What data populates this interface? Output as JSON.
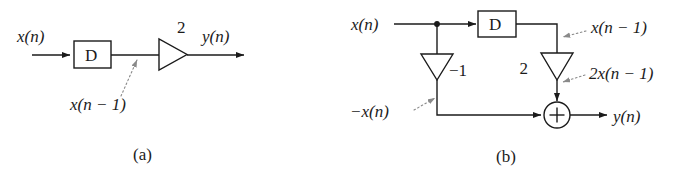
{
  "figure": {
    "background_color": "#ffffff",
    "line_color": "#1b1b1b",
    "leader_color": "#8a8a8a",
    "panels": [
      {
        "id": "panel-a",
        "caption": "(a)",
        "input_label": "x(n)",
        "output_label": "y(n)",
        "delay_block_label": "D",
        "gain_label": "2",
        "annotation_label": "x(n − 1)",
        "annotation_target": "delay-block-output-node"
      },
      {
        "id": "panel-b",
        "caption": "(b)",
        "input_label": "x(n)",
        "output_label": "y(n)",
        "delay_block_label": "D",
        "gain_top_label": "2",
        "gain_left_label": "−1",
        "summer_label": "+",
        "annotations": [
          {
            "text": "x(n − 1)",
            "target": "delay-output-wire"
          },
          {
            "text": "2x(n − 1)",
            "target": "gain-2-output-wire"
          },
          {
            "text": "−x(n)",
            "target": "gain-neg1-output-wire"
          }
        ]
      }
    ]
  }
}
